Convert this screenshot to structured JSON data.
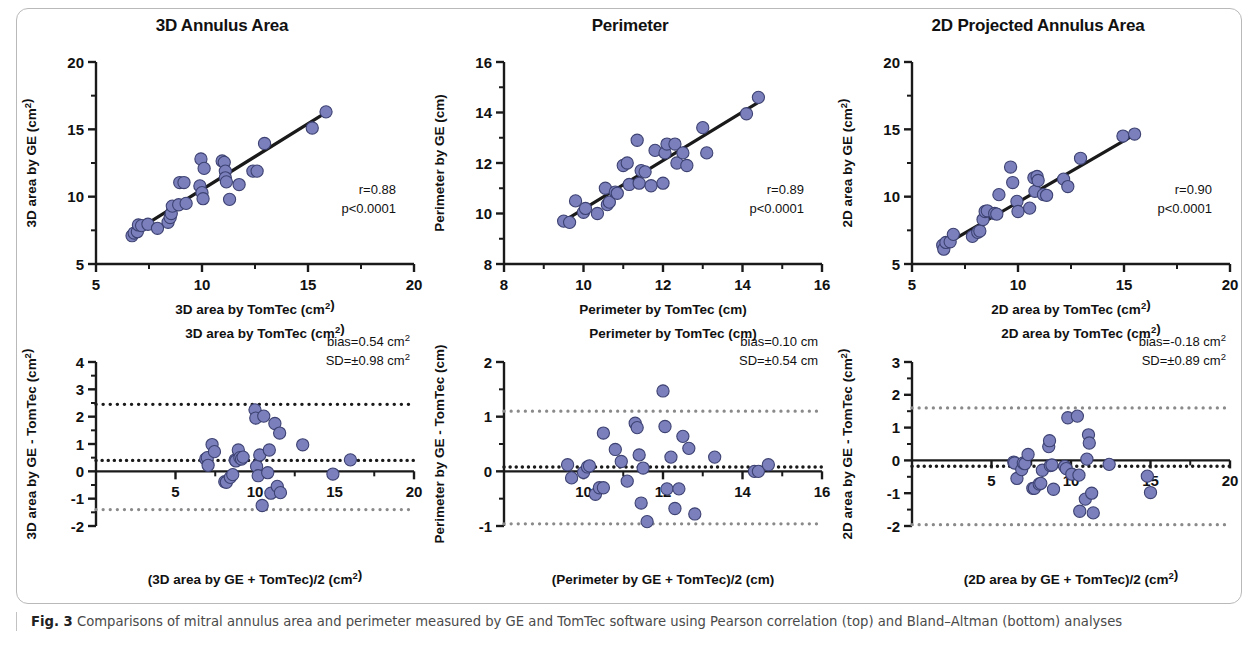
{
  "caption": {
    "label": "Fig. 3",
    "text": " Comparisons of mitral annulus area and perimeter measured by GE and TomTec software using Pearson correlation (top) and Bland–Altman (bottom) analyses"
  },
  "style": {
    "marker_fill": "#7b80bd",
    "marker_stroke": "#3d4272",
    "line_color": "#1a1a1a",
    "axis_color": "#1a1a1a",
    "loa_gray": "#8a8a8a",
    "loa_black": "#1a1a1a",
    "frame_color": "#b9b9b9"
  },
  "chart_data": [
    {
      "id": "corr-3d-annulus-area",
      "type": "scatter",
      "title": "3D Annulus Area",
      "xlabel": "3D area by TomTec (cm²)",
      "ylabel": "3D area by GE (cm²)",
      "xlim": [
        5,
        20
      ],
      "ylim": [
        5,
        20
      ],
      "xticks": [
        5,
        10,
        15,
        20
      ],
      "yticks": [
        5,
        10,
        15,
        20
      ],
      "minor_ticks": true,
      "grid": false,
      "annotations": [
        "r=0.88",
        "p<0.0001"
      ],
      "fit_line": {
        "x": [
          6.6,
          15.9
        ],
        "y": [
          7.2,
          16.3
        ]
      },
      "points": [
        [
          6.7,
          7.1
        ],
        [
          6.8,
          7.3
        ],
        [
          6.95,
          7.4
        ],
        [
          7.0,
          7.9
        ],
        [
          7.15,
          7.85
        ],
        [
          7.45,
          7.95
        ],
        [
          7.9,
          7.65
        ],
        [
          8.4,
          8.1
        ],
        [
          8.5,
          8.45
        ],
        [
          8.55,
          8.75
        ],
        [
          8.6,
          9.3
        ],
        [
          8.9,
          9.4
        ],
        [
          8.95,
          11.05
        ],
        [
          9.15,
          11.05
        ],
        [
          9.25,
          9.5
        ],
        [
          9.9,
          10.8
        ],
        [
          9.95,
          12.8
        ],
        [
          10.0,
          10.3
        ],
        [
          10.05,
          9.85
        ],
        [
          10.1,
          12.1
        ],
        [
          10.95,
          12.65
        ],
        [
          11.05,
          12.55
        ],
        [
          11.1,
          11.9
        ],
        [
          11.1,
          11.4
        ],
        [
          11.15,
          11.1
        ],
        [
          11.3,
          9.8
        ],
        [
          11.75,
          10.9
        ],
        [
          12.4,
          11.9
        ],
        [
          12.6,
          11.9
        ],
        [
          12.95,
          13.95
        ],
        [
          15.2,
          15.1
        ],
        [
          15.85,
          16.3
        ]
      ]
    },
    {
      "id": "corr-perimeter",
      "type": "scatter",
      "title": "Perimeter",
      "xlabel": "Perimeter by TomTec (cm)",
      "ylabel": "Perimeter by GE (cm)",
      "xlim": [
        8,
        16
      ],
      "ylim": [
        8,
        16
      ],
      "xticks": [
        8,
        10,
        12,
        14,
        16
      ],
      "yticks": [
        8,
        10,
        12,
        14,
        16
      ],
      "minor_ticks": true,
      "grid": false,
      "annotations": [
        "r=0.89",
        "p<0.0001"
      ],
      "fit_line": {
        "x": [
          9.5,
          14.45
        ],
        "y": [
          9.7,
          14.45
        ]
      },
      "points": [
        [
          9.5,
          9.7
        ],
        [
          9.65,
          9.65
        ],
        [
          9.8,
          10.5
        ],
        [
          10.0,
          10.05
        ],
        [
          10.05,
          10.2
        ],
        [
          10.35,
          10.0
        ],
        [
          10.55,
          11.0
        ],
        [
          10.6,
          10.35
        ],
        [
          10.65,
          10.45
        ],
        [
          10.8,
          10.85
        ],
        [
          10.85,
          10.8
        ],
        [
          11.0,
          11.9
        ],
        [
          11.1,
          12.0
        ],
        [
          11.15,
          11.15
        ],
        [
          11.35,
          12.9
        ],
        [
          11.4,
          11.2
        ],
        [
          11.45,
          11.7
        ],
        [
          11.55,
          11.65
        ],
        [
          11.7,
          11.1
        ],
        [
          11.8,
          12.5
        ],
        [
          12.0,
          11.2
        ],
        [
          12.05,
          12.4
        ],
        [
          12.1,
          12.75
        ],
        [
          12.3,
          12.75
        ],
        [
          12.35,
          12.0
        ],
        [
          12.5,
          12.4
        ],
        [
          12.6,
          11.9
        ],
        [
          13.0,
          13.4
        ],
        [
          13.1,
          12.4
        ],
        [
          14.1,
          13.95
        ],
        [
          14.4,
          14.6
        ]
      ]
    },
    {
      "id": "corr-2d-projected-annulus-area",
      "type": "scatter",
      "title": "2D Projected Annulus Area",
      "xlabel": "2D area by TomTec (cm²)",
      "ylabel": "2D area by GE (cm²)",
      "xlim": [
        5,
        20
      ],
      "ylim": [
        5,
        20
      ],
      "xticks": [
        5,
        10,
        15,
        20
      ],
      "yticks": [
        5,
        10,
        15,
        20
      ],
      "minor_ticks": true,
      "grid": false,
      "annotations": [
        "r=0.90",
        "p<0.0001"
      ],
      "fit_line": {
        "x": [
          6.4,
          15.6
        ],
        "y": [
          6.3,
          14.7
        ]
      },
      "points": [
        [
          6.45,
          6.4
        ],
        [
          6.5,
          6.1
        ],
        [
          6.6,
          6.6
        ],
        [
          6.8,
          6.65
        ],
        [
          6.95,
          7.2
        ],
        [
          7.85,
          7.05
        ],
        [
          8.1,
          7.35
        ],
        [
          8.2,
          7.45
        ],
        [
          8.35,
          8.3
        ],
        [
          8.45,
          8.9
        ],
        [
          8.55,
          8.95
        ],
        [
          8.9,
          8.75
        ],
        [
          9.0,
          8.7
        ],
        [
          9.1,
          10.15
        ],
        [
          9.65,
          12.2
        ],
        [
          9.75,
          11.05
        ],
        [
          9.95,
          9.65
        ],
        [
          10.0,
          8.9
        ],
        [
          10.55,
          9.15
        ],
        [
          10.75,
          11.4
        ],
        [
          10.8,
          10.4
        ],
        [
          10.9,
          11.5
        ],
        [
          10.95,
          11.2
        ],
        [
          11.2,
          10.15
        ],
        [
          11.35,
          10.1
        ],
        [
          12.15,
          11.3
        ],
        [
          12.35,
          10.75
        ],
        [
          12.95,
          12.85
        ],
        [
          14.95,
          14.5
        ],
        [
          15.5,
          14.65
        ]
      ]
    },
    {
      "id": "ba-3d-annulus-area",
      "type": "scatter",
      "title": "",
      "xlabel": "(3D area by GE + TomTec)/2 (cm²)",
      "ylabel": "3D area by GE - TomTec (cm²)",
      "toplabel": "3D area by TomTec (cm²)",
      "xlim": [
        0,
        20
      ],
      "ylim": [
        -2,
        4
      ],
      "xticks": [
        5,
        10,
        15,
        20
      ],
      "yticks": [
        -2,
        -1,
        0,
        1,
        2,
        3,
        4
      ],
      "minor_ticks": true,
      "grid": false,
      "annotations": [
        "bias=0.54 cm²",
        "SD=±0.98 cm²"
      ],
      "bias": 0.54,
      "sd": 0.98,
      "loa_upper": 2.45,
      "loa_mid": 0.4,
      "loa_lower": -1.4,
      "zero_line": 0,
      "points": [
        [
          6.9,
          0.45
        ],
        [
          7.0,
          0.5
        ],
        [
          7.05,
          0.22
        ],
        [
          7.3,
          0.98
        ],
        [
          7.45,
          0.72
        ],
        [
          8.1,
          -0.38
        ],
        [
          8.2,
          -0.4
        ],
        [
          8.45,
          -0.22
        ],
        [
          8.6,
          -0.12
        ],
        [
          8.75,
          0.42
        ],
        [
          8.8,
          0.38
        ],
        [
          8.95,
          0.78
        ],
        [
          9.05,
          0.5
        ],
        [
          9.15,
          0.45
        ],
        [
          9.25,
          0.52
        ],
        [
          10.0,
          2.25
        ],
        [
          10.05,
          1.95
        ],
        [
          10.1,
          0.18
        ],
        [
          10.2,
          -0.16
        ],
        [
          10.3,
          0.6
        ],
        [
          10.45,
          -1.25
        ],
        [
          10.55,
          2.02
        ],
        [
          10.8,
          -0.05
        ],
        [
          10.9,
          0.78
        ],
        [
          11.0,
          -0.8
        ],
        [
          11.25,
          1.75
        ],
        [
          11.4,
          -0.55
        ],
        [
          11.55,
          1.4
        ],
        [
          11.6,
          -0.78
        ],
        [
          13.0,
          0.97
        ],
        [
          14.9,
          -0.1
        ],
        [
          16.0,
          0.42
        ]
      ]
    },
    {
      "id": "ba-perimeter",
      "type": "scatter",
      "title": "",
      "xlabel": "(Perimeter by GE + TomTec)/2 (cm)",
      "ylabel": "Perimeter by GE - TomTec (cm)",
      "toplabel": "Perimeter by TomTec (cm)",
      "xlim": [
        8,
        16
      ],
      "ylim": [
        -1,
        2
      ],
      "xticks": [
        10,
        12,
        14,
        16
      ],
      "yticks": [
        -1,
        0,
        1,
        2
      ],
      "minor_ticks": true,
      "grid": false,
      "annotations": [
        "bias=0.10 cm",
        "SD=±0.54 cm"
      ],
      "bias": 0.1,
      "sd": 0.54,
      "loa_upper": 1.1,
      "loa_mid": 0.08,
      "loa_lower": -0.96,
      "zero_line": 0,
      "points": [
        [
          9.6,
          0.12
        ],
        [
          9.7,
          -0.12
        ],
        [
          10.0,
          -0.02
        ],
        [
          10.1,
          0.08
        ],
        [
          10.15,
          0.1
        ],
        [
          10.3,
          -0.42
        ],
        [
          10.4,
          -0.3
        ],
        [
          10.5,
          -0.3
        ],
        [
          10.5,
          0.7
        ],
        [
          10.8,
          0.4
        ],
        [
          10.95,
          0.18
        ],
        [
          11.1,
          -0.18
        ],
        [
          11.3,
          0.88
        ],
        [
          11.35,
          0.8
        ],
        [
          11.4,
          0.3
        ],
        [
          11.45,
          -0.58
        ],
        [
          11.5,
          0.06
        ],
        [
          11.6,
          -0.92
        ],
        [
          12.0,
          1.47
        ],
        [
          12.05,
          0.82
        ],
        [
          12.1,
          -0.32
        ],
        [
          12.2,
          0.26
        ],
        [
          12.3,
          -0.68
        ],
        [
          12.4,
          -0.32
        ],
        [
          12.5,
          0.64
        ],
        [
          12.65,
          0.42
        ],
        [
          12.8,
          -0.78
        ],
        [
          13.3,
          0.26
        ],
        [
          14.3,
          0.0
        ],
        [
          14.4,
          0.0
        ],
        [
          14.65,
          0.12
        ]
      ]
    },
    {
      "id": "ba-2d-projected-annulus-area",
      "type": "scatter",
      "title": "",
      "xlabel": "(2D area by GE + TomTec)/2 (cm²)",
      "ylabel": "2D area by GE - TomTec (cm²)",
      "toplabel": "2D area by TomTec (cm²)",
      "xlim": [
        0,
        20
      ],
      "ylim": [
        -2,
        3
      ],
      "xticks": [
        5,
        10,
        15,
        20
      ],
      "yticks": [
        -2,
        -1,
        0,
        1,
        2,
        3
      ],
      "minor_ticks": true,
      "grid": false,
      "annotations": [
        "bias=-0.18 cm²",
        "SD=±0.89 cm²"
      ],
      "bias": -0.18,
      "sd": 0.89,
      "loa_upper": 1.6,
      "loa_mid": -0.18,
      "loa_lower": -1.96,
      "zero_line": 0,
      "points": [
        [
          6.4,
          -0.05
        ],
        [
          6.45,
          -0.08
        ],
        [
          6.6,
          -0.55
        ],
        [
          6.9,
          -0.28
        ],
        [
          7.0,
          -0.08
        ],
        [
          7.1,
          -0.1
        ],
        [
          7.3,
          0.18
        ],
        [
          7.6,
          -0.85
        ],
        [
          7.7,
          -0.85
        ],
        [
          8.0,
          -0.72
        ],
        [
          8.1,
          -0.7
        ],
        [
          8.2,
          -0.3
        ],
        [
          8.6,
          0.42
        ],
        [
          8.65,
          0.6
        ],
        [
          8.7,
          -0.16
        ],
        [
          8.8,
          -0.14
        ],
        [
          8.9,
          -0.88
        ],
        [
          9.6,
          -0.18
        ],
        [
          9.7,
          -0.25
        ],
        [
          9.8,
          1.3
        ],
        [
          10.05,
          -0.42
        ],
        [
          10.4,
          1.35
        ],
        [
          10.5,
          -0.45
        ],
        [
          10.55,
          -1.55
        ],
        [
          10.9,
          -1.18
        ],
        [
          11.0,
          0.04
        ],
        [
          11.1,
          0.78
        ],
        [
          11.15,
          0.53
        ],
        [
          11.3,
          -1.0
        ],
        [
          11.4,
          -1.6
        ],
        [
          12.4,
          -0.12
        ],
        [
          14.8,
          -0.48
        ],
        [
          15.0,
          -0.98
        ]
      ]
    }
  ]
}
